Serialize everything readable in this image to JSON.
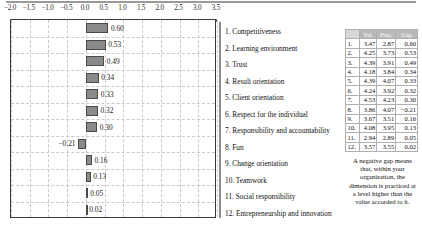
{
  "chart_data": {
    "type": "bar",
    "title": "",
    "xlabel": "",
    "ylabel": "",
    "orientation": "horizontal",
    "xlim": [
      -2.0,
      3.5
    ],
    "grid": true,
    "xticks": [
      "-2.0",
      "-1.5",
      "-1.0",
      "-0.5",
      "0.0",
      "0.5",
      "1.0",
      "1.5",
      "2.0",
      "2.5",
      "3.0",
      "3.5"
    ],
    "xtick_values": [
      -2.0,
      -1.5,
      -1.0,
      -0.5,
      0.0,
      0.5,
      1.0,
      1.5,
      2.0,
      2.5,
      3.0,
      3.5
    ],
    "categories": [
      "1. Competitiveness",
      "2. Learning environment",
      "3. Trust",
      "4. Result orientation",
      "5. Client orientation",
      "6. Respect for the individual",
      "7. Responsibility and accountability",
      "8. Fun",
      "9. Change orientation",
      "10. Teamwork",
      "11. Social responsibility",
      "12. Entrepreneurship and innovation"
    ],
    "values": [
      0.6,
      0.53,
      0.49,
      0.34,
      0.33,
      0.32,
      0.3,
      -0.21,
      0.16,
      0.13,
      0.05,
      0.02
    ],
    "data_labels": [
      "0.60",
      "0.53",
      "0.49",
      "0.34",
      "0.33",
      "0.32",
      "0.30",
      "-0.21",
      "0.16",
      "0.13",
      "0.05",
      "0.02"
    ],
    "bar_color": "#8a8a8a",
    "bar_border_color": "#4a4a4a"
  },
  "legend": {
    "items": [
      "1. Competitiveness",
      "2. Learning environment",
      "3. Trust",
      "4. Result orientation",
      "5. Client orientation",
      "6. Respect for the individual",
      "7. Responsibility and accountability",
      "8. Fun",
      "9. Change orientation",
      "10. Teamwork",
      "11. Social responsibility",
      "12. Entrepreneurship and innovation"
    ]
  },
  "table": {
    "headers": [
      "",
      "Val.",
      "Prac.",
      "Gap"
    ],
    "rows": [
      {
        "idx": "1.",
        "val": "3.47",
        "prac": "2.87",
        "gap": "0.60"
      },
      {
        "idx": "2.",
        "val": "4.25",
        "prac": "3.73",
        "gap": "0.53"
      },
      {
        "idx": "3.",
        "val": "4.39",
        "prac": "3.91",
        "gap": "0.49"
      },
      {
        "idx": "4.",
        "val": "4.18",
        "prac": "3.84",
        "gap": "0.34"
      },
      {
        "idx": "5.",
        "val": "4.39",
        "prac": "4.07",
        "gap": "0.33"
      },
      {
        "idx": "6.",
        "val": "4.24",
        "prac": "3.92",
        "gap": "0.32"
      },
      {
        "idx": "7.",
        "val": "4.53",
        "prac": "4.23",
        "gap": "0.30"
      },
      {
        "idx": "8.",
        "val": "3.86",
        "prac": "4.07",
        "gap": "-0.21"
      },
      {
        "idx": "9.",
        "val": "3.67",
        "prac": "3.51",
        "gap": "0.16"
      },
      {
        "idx": "10.",
        "val": "4.08",
        "prac": "3.95",
        "gap": "0.13"
      },
      {
        "idx": "11.",
        "val": "2.94",
        "prac": "2.89",
        "gap": "0.05"
      },
      {
        "idx": "12.",
        "val": "3.57",
        "prac": "3.55",
        "gap": "0.02"
      }
    ]
  },
  "footnote": {
    "text": "A negative gap means that, within your organization, the dimension is practiced at a level higher than the value accorded to it."
  }
}
